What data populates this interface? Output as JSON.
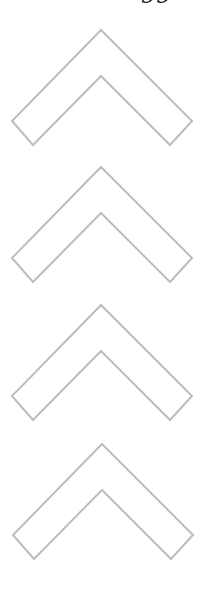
{
  "header": {
    "clipped_text": "gg"
  },
  "chevrons": {
    "count": 4,
    "direction": "up",
    "stroke_color": "#bdbdbd",
    "fill_color": "#ffffff",
    "items": [
      {
        "label": "chevron-1",
        "top": 28
      },
      {
        "label": "chevron-2",
        "top": 165
      },
      {
        "label": "chevron-3",
        "top": 303
      },
      {
        "label": "chevron-4",
        "top": 442
      }
    ]
  }
}
